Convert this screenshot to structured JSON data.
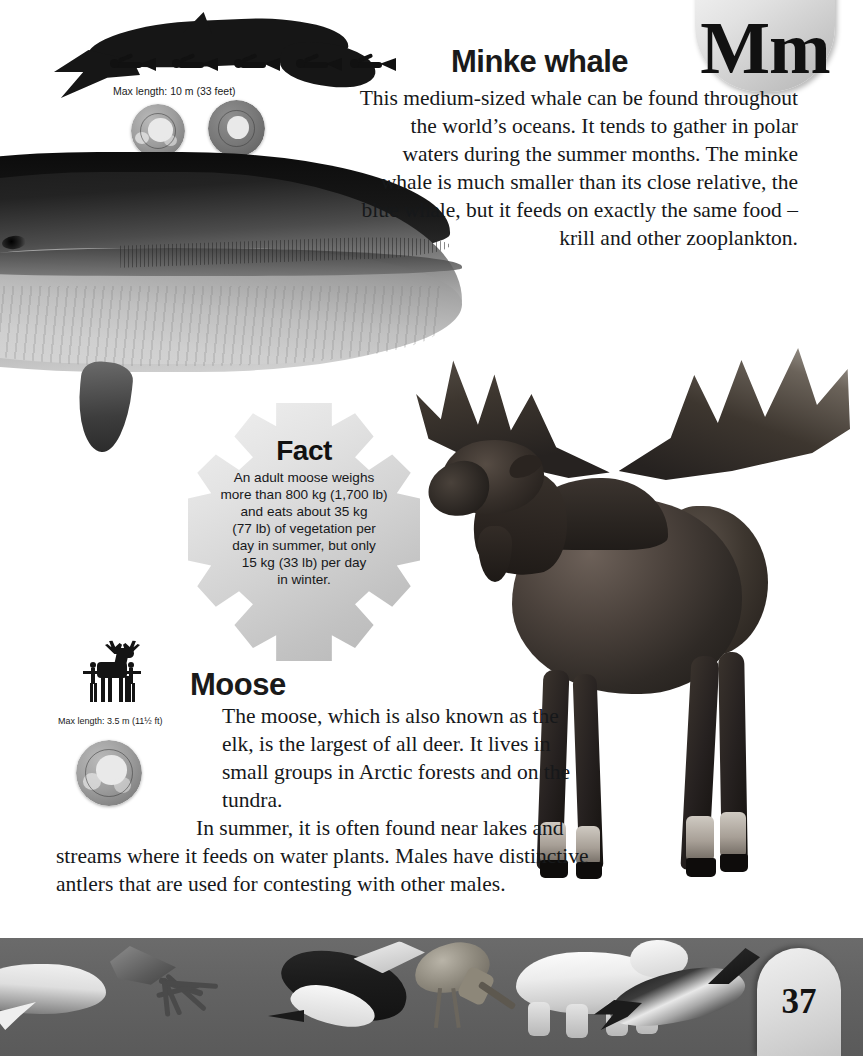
{
  "page": {
    "letter_tab": "Mm",
    "page_number": "37",
    "band_color": "#636363",
    "tab_color": "#dcdcdc",
    "text_color": "#16181a"
  },
  "sections": [
    {
      "id": "minke-whale",
      "heading": "Minke whale",
      "body": "This medium-sized whale can be found throughout the world’s oceans. It tends to gather in polar waters during the summer months. The minke whale is much smaller than its close relative, the blue whale, but it feeds on exactly the same food – krill and other zooplankton.",
      "scale_caption": "Max length: 10 m (33 feet)",
      "silhouette": "minke-whale-silhouette-with-divers",
      "globes": [
        "arctic-globe",
        "antarctic-globe"
      ]
    },
    {
      "id": "moose",
      "heading": "Moose",
      "body_lines": [
        "The moose, which is also known as the",
        "elk, is the largest of all deer. It lives in",
        "small groups in Arctic forests and on the tundra.",
        "In summer, it is often found near lakes and",
        "streams where it feeds on water plants. Males have distinctive",
        "antlers that are used for contesting with other males."
      ],
      "scale_caption": "Max length: 3.5 m (11½ ft)",
      "silhouette": "moose-silhouette-with-humans",
      "globes": [
        "arctic-globe"
      ]
    }
  ],
  "fact_box": {
    "title": "Fact",
    "lines": [
      "An adult moose weighs",
      "more than 800 kg (1,700 lb)",
      "and eats about 35 kg",
      "(77 lb) of vegetation per",
      "day in summer, but only",
      "15 kg (33 lb) per day",
      "in winter."
    ],
    "shape": "snowflake"
  },
  "illustrations": [
    {
      "name": "minke-whale-illustration",
      "subject": "Minke whale head and body"
    },
    {
      "name": "moose-illustration",
      "subject": "Bull moose with antlers"
    }
  ],
  "bottom_band_figures": [
    "beluga-whale-figure",
    "squid-figure",
    "penguin-figure",
    "wading-bird-figure",
    "polar-bear-figure",
    "dolphin-figure"
  ]
}
